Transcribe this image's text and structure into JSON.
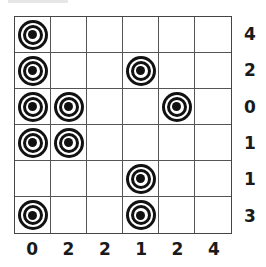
{
  "puzzle": {
    "rows": 6,
    "cols": 6,
    "row_clues": [
      "4",
      "2",
      "0",
      "1",
      "1",
      "3"
    ],
    "col_clues": [
      "0",
      "2",
      "2",
      "1",
      "2",
      "4"
    ],
    "targets": [
      [
        true,
        false,
        false,
        false,
        false,
        false
      ],
      [
        true,
        false,
        false,
        true,
        false,
        false
      ],
      [
        true,
        true,
        false,
        false,
        true,
        false
      ],
      [
        true,
        true,
        false,
        false,
        false,
        false
      ],
      [
        false,
        false,
        false,
        true,
        false,
        false
      ],
      [
        true,
        false,
        false,
        true,
        false,
        false
      ]
    ],
    "target_icon": "bullseye-target-icon"
  },
  "colors": {
    "grid_line": "#555555",
    "target": "#111111",
    "label": "#1a1a1a",
    "background": "#ffffff"
  }
}
